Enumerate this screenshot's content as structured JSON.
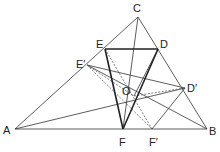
{
  "diagram": {
    "type": "geometry",
    "points": {
      "A": {
        "x": 15,
        "y": 129,
        "label": "A",
        "lx": 3,
        "ly": 134
      },
      "B": {
        "x": 207,
        "y": 129,
        "label": "B",
        "lx": 209,
        "ly": 135
      },
      "C": {
        "x": 138,
        "y": 17,
        "label": "C",
        "lx": 133,
        "ly": 12
      },
      "E": {
        "x": 105,
        "y": 49,
        "label": "E",
        "lx": 96,
        "ly": 48
      },
      "D": {
        "x": 158,
        "y": 49,
        "label": "D",
        "lx": 160,
        "ly": 48
      },
      "E1": {
        "x": 87,
        "y": 65,
        "label": "E′",
        "lx": 76,
        "ly": 68
      },
      "D1": {
        "x": 185,
        "y": 88,
        "label": "D′",
        "lx": 187,
        "ly": 92
      },
      "F": {
        "x": 123,
        "y": 129,
        "label": "F",
        "lx": 119,
        "ly": 146
      },
      "F1": {
        "x": 152,
        "y": 129,
        "label": "F′",
        "lx": 149,
        "ly": 146
      },
      "O": {
        "x": 134,
        "y": 96,
        "label": "O",
        "lx": 122,
        "ly": 95
      }
    },
    "solid_thin": [
      [
        "A",
        "B"
      ],
      [
        "B",
        "C"
      ],
      [
        "C",
        "A"
      ],
      [
        "C",
        "F"
      ],
      [
        "A",
        "D1"
      ],
      [
        "E1",
        "D1"
      ],
      [
        "E1",
        "B"
      ],
      [
        "D1",
        "F1"
      ],
      [
        "D",
        "O"
      ]
    ],
    "solid_thick": [
      [
        "E",
        "D"
      ],
      [
        "D",
        "F"
      ],
      [
        "F",
        "E"
      ]
    ],
    "dashed": [
      [
        "E",
        "F1"
      ],
      [
        "E1",
        "O"
      ],
      [
        "O",
        "D1"
      ],
      [
        "E1",
        "F1"
      ],
      [
        "D",
        "F"
      ]
    ]
  }
}
